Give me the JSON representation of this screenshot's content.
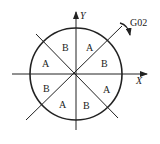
{
  "diagram": {
    "axes": {
      "x_label": "X",
      "y_label": "Y"
    },
    "direction": {
      "label": "G02",
      "meaning": "clockwise circular interpolation"
    },
    "sectors": [
      {
        "id": "s1",
        "label": "A",
        "position": "upper-right-upper"
      },
      {
        "id": "s2",
        "label": "B",
        "position": "upper-right-lower"
      },
      {
        "id": "s3",
        "label": "A",
        "position": "lower-right-upper"
      },
      {
        "id": "s4",
        "label": "B",
        "position": "lower-right-lower"
      },
      {
        "id": "s5",
        "label": "A",
        "position": "lower-left-lower"
      },
      {
        "id": "s6",
        "label": "B",
        "position": "lower-left-upper"
      },
      {
        "id": "s7",
        "label": "A",
        "position": "upper-left-lower"
      },
      {
        "id": "s8",
        "label": "B",
        "position": "upper-left-upper"
      }
    ],
    "colors": {
      "stroke": "#222222",
      "background": "#ffffff"
    }
  }
}
